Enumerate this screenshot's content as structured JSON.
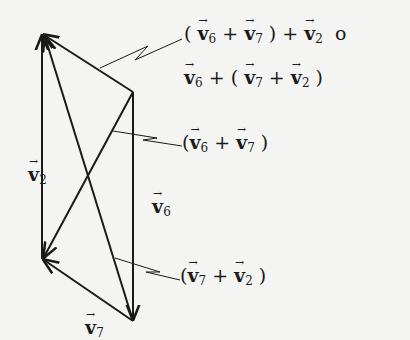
{
  "diagram": {
    "vertices": {
      "A": {
        "x": 42,
        "y": 34
      },
      "B": {
        "x": 133,
        "y": 92
      },
      "C": {
        "x": 133,
        "y": 321
      },
      "D": {
        "x": 42,
        "y": 259
      }
    },
    "labels": {
      "v2": {
        "letter": "v",
        "sub": "2"
      },
      "v6": {
        "letter": "v",
        "sub": "6"
      },
      "v7": {
        "letter": "v",
        "sub": "7"
      }
    },
    "annotations": {
      "top_line1": "( v6 + v7 ) + v2 or",
      "top_line2": "v6 + ( v7 + v2 )",
      "middle": "( v6 + v7 )",
      "bottom": "( v7 + v2 )"
    }
  }
}
